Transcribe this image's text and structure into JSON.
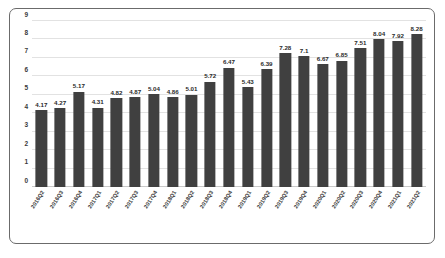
{
  "chart_data": {
    "type": "bar",
    "title": "",
    "subtitle": "",
    "xlabel": "",
    "ylabel": "",
    "ylim": [
      0,
      9
    ],
    "ytick_step": 1,
    "yticks": [
      0,
      1,
      2,
      3,
      4,
      5,
      6,
      7,
      8,
      9
    ],
    "grid": true,
    "legend": false,
    "legend_position": "none",
    "bar_color": "#404040",
    "grid_color": "#e2e2e2",
    "frame_color": "#6b6b6b",
    "label_color": "#2a2a2a",
    "categories": [
      "2016Q2",
      "2016Q3",
      "2016Q4",
      "2017Q1",
      "2017Q2",
      "2017Q3",
      "2017Q4",
      "2018Q1",
      "2018Q2",
      "2018Q3",
      "2018Q4",
      "2019Q1",
      "2019Q2",
      "2019Q3",
      "2019Q4",
      "2020Q1",
      "2020Q2",
      "2020Q3",
      "2020Q4",
      "2021Q1",
      "2021Q2"
    ],
    "values": [
      4.17,
      4.27,
      5.17,
      4.31,
      4.82,
      4.87,
      5.04,
      4.86,
      5.01,
      5.72,
      6.47,
      5.43,
      6.39,
      7.28,
      7.1,
      6.67,
      6.85,
      7.51,
      8.04,
      7.92,
      8.28
    ],
    "value_labels": [
      "4.17",
      "4.27",
      "5.17",
      "4.31",
      "4.82",
      "4.87",
      "5.04",
      "4.86",
      "5.01",
      "5.72",
      "6.47",
      "5.43",
      "6.39",
      "7.28",
      "7.1",
      "6.67",
      "6.85",
      "7.51",
      "8.04",
      "7.92",
      "8.28"
    ]
  }
}
